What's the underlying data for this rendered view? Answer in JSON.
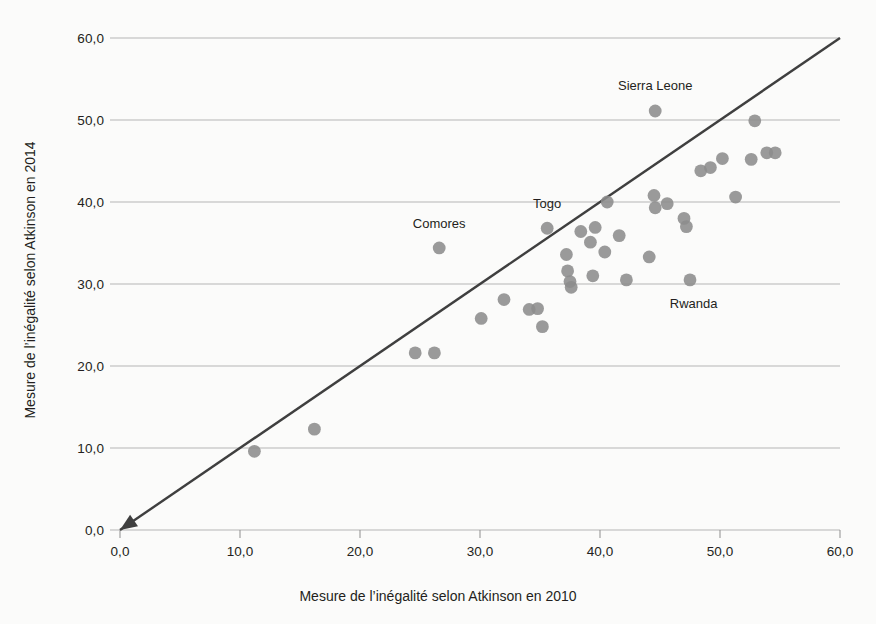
{
  "chart_data": {
    "type": "scatter",
    "title": "",
    "xlabel": "Mesure de l’inégalité selon Atkinson en 2010",
    "ylabel": "Mesure de l’inégalité selon Atkinson en 2014",
    "xlim": [
      0,
      60
    ],
    "ylim": [
      0,
      60
    ],
    "xticks": [
      "0,0",
      "10,0",
      "20,0",
      "30,0",
      "40,0",
      "50,0",
      "60,0"
    ],
    "xtick_values": [
      0,
      10,
      20,
      30,
      40,
      50,
      60
    ],
    "yticks": [
      "0,0",
      "10,0",
      "20,0",
      "30,0",
      "40,0",
      "50,0",
      "60,0"
    ],
    "ytick_values": [
      0,
      10,
      20,
      30,
      40,
      50,
      60
    ],
    "grid": "horizontal",
    "legend": "none",
    "marker_color": "#8c8c8c",
    "line_color": "#3f3f3f",
    "grid_color": "#b5b5b5",
    "axis_color": "#8f8f8f",
    "reference_line": {
      "name": "diagonale 45 degres",
      "from": [
        0,
        0
      ],
      "to": [
        60,
        60
      ],
      "arrow_at": "origin"
    },
    "points": [
      {
        "x": 11.2,
        "y": 9.6
      },
      {
        "x": 16.2,
        "y": 12.3
      },
      {
        "x": 24.6,
        "y": 21.6
      },
      {
        "x": 26.2,
        "y": 21.6
      },
      {
        "x": 26.6,
        "y": 34.4,
        "label": "Comores"
      },
      {
        "x": 30.1,
        "y": 25.8
      },
      {
        "x": 32.0,
        "y": 28.1
      },
      {
        "x": 34.1,
        "y": 26.9
      },
      {
        "x": 34.8,
        "y": 27.0
      },
      {
        "x": 35.2,
        "y": 24.8
      },
      {
        "x": 35.6,
        "y": 36.8,
        "label": "Togo"
      },
      {
        "x": 37.2,
        "y": 33.6
      },
      {
        "x": 37.3,
        "y": 31.6
      },
      {
        "x": 37.5,
        "y": 30.3
      },
      {
        "x": 37.6,
        "y": 29.6
      },
      {
        "x": 38.4,
        "y": 36.4
      },
      {
        "x": 39.2,
        "y": 35.1
      },
      {
        "x": 39.6,
        "y": 36.9
      },
      {
        "x": 39.4,
        "y": 31.0
      },
      {
        "x": 40.4,
        "y": 33.9
      },
      {
        "x": 40.6,
        "y": 40.0
      },
      {
        "x": 41.6,
        "y": 35.9
      },
      {
        "x": 42.2,
        "y": 30.5
      },
      {
        "x": 44.6,
        "y": 51.1,
        "label": "Sierra Leone"
      },
      {
        "x": 44.5,
        "y": 40.8
      },
      {
        "x": 44.6,
        "y": 39.3
      },
      {
        "x": 45.6,
        "y": 39.8
      },
      {
        "x": 44.1,
        "y": 33.3
      },
      {
        "x": 47.0,
        "y": 38.0
      },
      {
        "x": 47.2,
        "y": 37.0
      },
      {
        "x": 47.5,
        "y": 30.5,
        "label": "Rwanda"
      },
      {
        "x": 48.4,
        "y": 43.8
      },
      {
        "x": 49.2,
        "y": 44.2
      },
      {
        "x": 50.2,
        "y": 45.3
      },
      {
        "x": 51.3,
        "y": 40.6
      },
      {
        "x": 52.6,
        "y": 45.2
      },
      {
        "x": 52.9,
        "y": 49.9
      },
      {
        "x": 53.9,
        "y": 46.0
      },
      {
        "x": 54.6,
        "y": 46.0
      }
    ],
    "annotations": [
      {
        "text": "Comores",
        "x": 26.6,
        "y": 37.2
      },
      {
        "text": "Togo",
        "x": 35.6,
        "y": 39.6
      },
      {
        "text": "Sierra Leone",
        "x": 44.6,
        "y": 54.0
      },
      {
        "text": "Rwanda",
        "x": 47.8,
        "y": 27.4
      }
    ]
  }
}
